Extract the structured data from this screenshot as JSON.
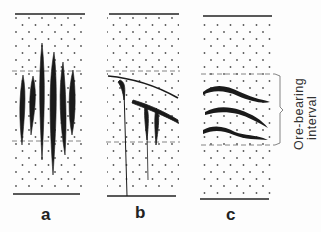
{
  "panels": [
    {
      "label": "a",
      "description": "vertical elongated ore bodies spanning the interval"
    },
    {
      "label": "b",
      "description": "inclined ore bodies with vertical feeders"
    },
    {
      "label": "c",
      "description": "stratiform lenticular ore layers"
    }
  ],
  "annotation": {
    "line1": "Ore-bearing",
    "line2": "interval"
  },
  "colors": {
    "ink": "#1f1f1f",
    "dots": "#555555",
    "background": "#fdfdfd"
  }
}
